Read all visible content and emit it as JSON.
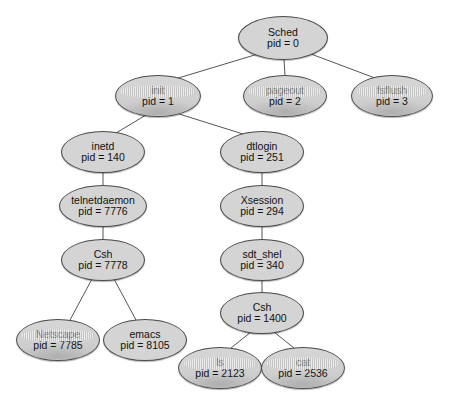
{
  "diagram": {
    "type": "process-tree",
    "node_fill_color": "#d4d4d4",
    "node_stroke_color": "#4a4a4a",
    "edge_color": "#555555",
    "background_color": "#ffffff",
    "nodes": [
      {
        "id": "sched",
        "name": "Sched",
        "pid_label": "pid = 0",
        "cx": 283,
        "cy": 38,
        "rx": 45,
        "ry": 22,
        "degraded": false
      },
      {
        "id": "init",
        "name": "init",
        "pid_label": "pid = 1",
        "cx": 158,
        "cy": 96,
        "rx": 43,
        "ry": 21,
        "degraded": true
      },
      {
        "id": "pageout",
        "name": "pageout",
        "pid_label": "pid = 2",
        "cx": 285,
        "cy": 96,
        "rx": 42,
        "ry": 21,
        "degraded": true
      },
      {
        "id": "fsflush",
        "name": "fsflush",
        "pid_label": "pid = 3",
        "cx": 392,
        "cy": 96,
        "rx": 41,
        "ry": 21,
        "degraded": true
      },
      {
        "id": "inetd",
        "name": "inetd",
        "pid_label": "pid = 140",
        "cx": 103,
        "cy": 152,
        "rx": 42,
        "ry": 21,
        "degraded": false
      },
      {
        "id": "dtlogin",
        "name": "dtlogin",
        "pid_label": "pid = 251",
        "cx": 262,
        "cy": 152,
        "rx": 42,
        "ry": 21,
        "degraded": false
      },
      {
        "id": "telnetdaemon",
        "name": "telnetdaemon",
        "pid_label": "pid = 7776",
        "cx": 103,
        "cy": 206,
        "rx": 44,
        "ry": 21,
        "degraded": false
      },
      {
        "id": "xsession",
        "name": "Xsession",
        "pid_label": "pid = 294",
        "cx": 262,
        "cy": 206,
        "rx": 42,
        "ry": 21,
        "degraded": false
      },
      {
        "id": "csh7778",
        "name": "Csh",
        "pid_label": "pid = 7778",
        "cx": 103,
        "cy": 260,
        "rx": 42,
        "ry": 21,
        "degraded": false
      },
      {
        "id": "sdt_shel",
        "name": "sdt_shel",
        "pid_label": "pid = 340",
        "cx": 262,
        "cy": 260,
        "rx": 42,
        "ry": 21,
        "degraded": false
      },
      {
        "id": "csh1400",
        "name": "Csh",
        "pid_label": "pid = 1400",
        "cx": 262,
        "cy": 313,
        "rx": 42,
        "ry": 21,
        "degraded": false
      },
      {
        "id": "netscape",
        "name": "Netscape",
        "pid_label": "pid = 7785",
        "cx": 58,
        "cy": 340,
        "rx": 42,
        "ry": 21,
        "degraded": true
      },
      {
        "id": "emacs",
        "name": "emacs",
        "pid_label": "pid = 8105",
        "cx": 145,
        "cy": 340,
        "rx": 42,
        "ry": 21,
        "degraded": false
      },
      {
        "id": "ls",
        "name": "ls",
        "pid_label": "pid = 2123",
        "cx": 220,
        "cy": 368,
        "rx": 42,
        "ry": 21,
        "degraded": true
      },
      {
        "id": "cat",
        "name": "cat",
        "pid_label": "pid = 2536",
        "cx": 303,
        "cy": 368,
        "rx": 42,
        "ry": 21,
        "degraded": true
      }
    ],
    "edges": [
      {
        "from": "sched",
        "to": "init",
        "x1": 258,
        "y1": 54,
        "x2": 175,
        "y2": 79
      },
      {
        "from": "sched",
        "to": "pageout",
        "x1": 284,
        "y1": 60,
        "x2": 285,
        "y2": 75
      },
      {
        "from": "sched",
        "to": "fsflush",
        "x1": 311,
        "y1": 54,
        "x2": 375,
        "y2": 78
      },
      {
        "from": "init",
        "to": "inetd",
        "x1": 146,
        "y1": 115,
        "x2": 116,
        "y2": 133
      },
      {
        "from": "init",
        "to": "dtlogin",
        "x1": 176,
        "y1": 113,
        "x2": 243,
        "y2": 134
      },
      {
        "from": "inetd",
        "to": "telnetdaemon",
        "x1": 103,
        "y1": 173,
        "x2": 103,
        "y2": 185
      },
      {
        "from": "telnetdaemon",
        "to": "csh7778",
        "x1": 103,
        "y1": 227,
        "x2": 103,
        "y2": 239
      },
      {
        "from": "csh7778",
        "to": "netscape",
        "x1": 92,
        "y1": 279,
        "x2": 70,
        "y2": 320
      },
      {
        "from": "csh7778",
        "to": "emacs",
        "x1": 114,
        "y1": 279,
        "x2": 136,
        "y2": 320
      },
      {
        "from": "dtlogin",
        "to": "xsession",
        "x1": 262,
        "y1": 173,
        "x2": 262,
        "y2": 185
      },
      {
        "from": "xsession",
        "to": "sdt_shel",
        "x1": 262,
        "y1": 227,
        "x2": 262,
        "y2": 239
      },
      {
        "from": "sdt_shel",
        "to": "csh1400",
        "x1": 262,
        "y1": 281,
        "x2": 262,
        "y2": 292
      },
      {
        "from": "csh1400",
        "to": "ls",
        "x1": 251,
        "y1": 332,
        "x2": 231,
        "y2": 348
      },
      {
        "from": "csh1400",
        "to": "cat",
        "x1": 274,
        "y1": 332,
        "x2": 294,
        "y2": 348
      }
    ]
  }
}
